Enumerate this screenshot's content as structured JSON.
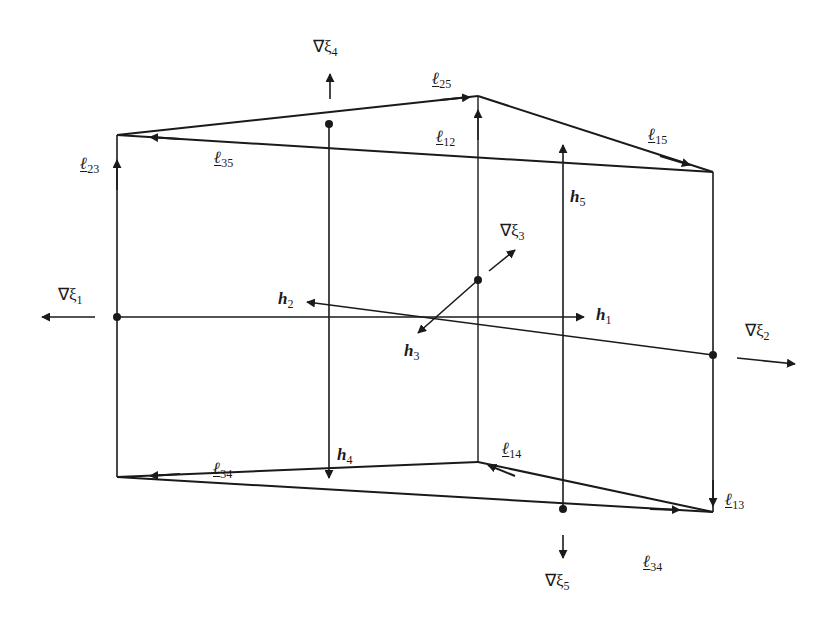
{
  "figure": {
    "colors": {
      "line": "#1a1a1a",
      "background": "#ffffff"
    },
    "vertices": {
      "top_left": [
        117,
        135
      ],
      "top_apex": [
        478,
        96
      ],
      "top_right": [
        713,
        172
      ],
      "bottom_left": [
        117,
        477
      ],
      "bottom_mid": [
        478,
        462
      ],
      "bottom_right": [
        713,
        512
      ]
    },
    "labels": {
      "grad_xi1": {
        "sym": "∇ξ",
        "sub": "1"
      },
      "grad_xi2": {
        "sym": "∇ξ",
        "sub": "2"
      },
      "grad_xi3": {
        "sym": "∇ξ",
        "sub": "3"
      },
      "grad_xi4": {
        "sym": "∇ξ",
        "sub": "4"
      },
      "grad_xi5": {
        "sym": "∇ξ",
        "sub": "5"
      },
      "h1": {
        "sym": "h",
        "sub": "1"
      },
      "h2": {
        "sym": "h",
        "sub": "2"
      },
      "h3": {
        "sym": "h",
        "sub": "3"
      },
      "h4": {
        "sym": "h",
        "sub": "4"
      },
      "h5": {
        "sym": "h",
        "sub": "5"
      },
      "l12": {
        "sym": "ℓ",
        "sub": "12"
      },
      "l13": {
        "sym": "ℓ",
        "sub": "13"
      },
      "l14": {
        "sym": "ℓ",
        "sub": "14"
      },
      "l15": {
        "sym": "ℓ",
        "sub": "15"
      },
      "l23": {
        "sym": "ℓ",
        "sub": "23"
      },
      "l25": {
        "sym": "ℓ",
        "sub": "25"
      },
      "l34_bottom_left": {
        "sym": "ℓ",
        "sub": "34"
      },
      "l34_bottom_right": {
        "sym": "ℓ",
        "sub": "34"
      },
      "l35": {
        "sym": "ℓ",
        "sub": "35"
      }
    }
  }
}
